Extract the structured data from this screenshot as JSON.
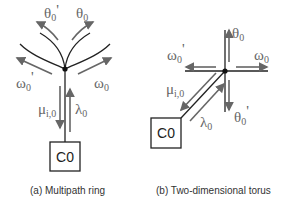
{
  "diagrams": [
    {
      "id": "a",
      "caption": "(a) Multipath ring",
      "node_box": "C0",
      "labels": {
        "theta_prime": "θ",
        "theta_prime_sub": "0",
        "theta_prime_mark": "'",
        "theta": "θ",
        "theta_sub": "0",
        "omega_prime": "ω",
        "omega_prime_sub": "0",
        "omega_prime_mark": "'",
        "omega": "ω",
        "omega_sub": "0",
        "mu": "μ",
        "mu_sub": "i,0",
        "lambda": "λ",
        "lambda_sub": "0"
      }
    },
    {
      "id": "b",
      "caption": "(b) Two-dimensional torus",
      "node_box": "C0",
      "labels": {
        "theta": "θ",
        "theta_sub": "0",
        "theta_prime": "θ",
        "theta_prime_sub": "0",
        "theta_prime_mark": "'",
        "omega_prime": "ω",
        "omega_prime_sub": "0",
        "omega_prime_mark": "'",
        "omega": "ω",
        "omega_sub": "0",
        "mu": "μ",
        "mu_sub": "i,0",
        "lambda": "λ",
        "lambda_sub": "0"
      }
    }
  ],
  "colors": {
    "line": "#222222",
    "arrow": "#666666",
    "label": "#666666"
  }
}
